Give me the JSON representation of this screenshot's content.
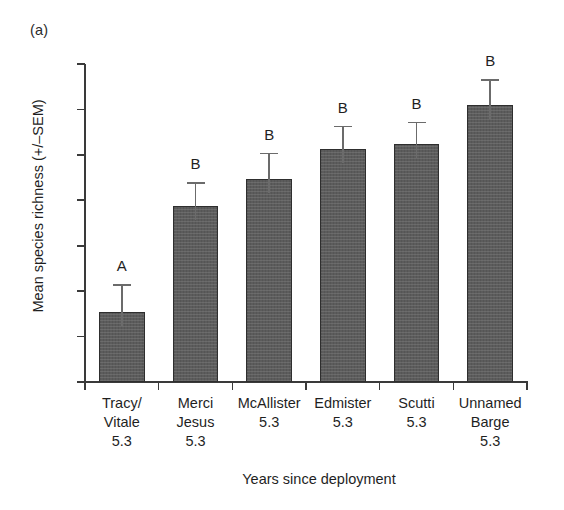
{
  "panel": {
    "label": "(a)"
  },
  "chart_data": {
    "type": "bar",
    "title": "",
    "subtitle": "",
    "xlabel": "Years since deployment",
    "ylabel": "Mean species richness (+/–SEM)",
    "categories": [
      "Tracy/\nVitale\n5.3",
      "Merci\nJesus\n5.3",
      "McAllister\n5.3",
      "Edmister\n5.3",
      "Scutti\n5.3",
      "Unnamed\nBarge\n5.3"
    ],
    "category_names": [
      "Tracy/ Vitale",
      "Merci Jesus",
      "McAllister",
      "Edmister",
      "Scutti",
      "Unnamed Barge"
    ],
    "years_since_deployment": [
      5.3,
      5.3,
      5.3,
      5.3,
      5.3,
      5.3
    ],
    "values": [
      18.55,
      20.88,
      21.47,
      22.12,
      22.23,
      23.1
    ],
    "errors": [
      0.6,
      0.52,
      0.58,
      0.52,
      0.5,
      0.56
    ],
    "annotations": [
      "A",
      "B",
      "B",
      "B",
      "B",
      "B"
    ],
    "ylim": [
      17,
      24
    ],
    "yticks": [
      24,
      23,
      22,
      21,
      20,
      19,
      18,
      17
    ],
    "ytick_labels": [
      "24",
      "23",
      "22",
      "21",
      "20",
      "19",
      "18",
      "17"
    ],
    "grid": false,
    "legend": "none",
    "error_type": "SEM",
    "bar_color": "#5c5c5c",
    "bar_edge_color": "#2e2e2e",
    "error_bar_color": "#6b6b6b",
    "axis_color": "#3a3a3a",
    "background_color": "#ffffff",
    "text_color": "#1f1f1f"
  }
}
